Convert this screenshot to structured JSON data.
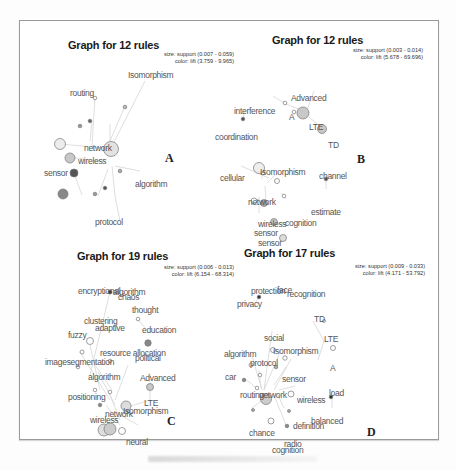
{
  "figure": {
    "caption_visible_text": ""
  },
  "panels": [
    {
      "id": "A",
      "title": "Graph for 12 rules",
      "legend_size": "size: support (0.007 - 0.059)",
      "legend_color": "color: lift (3.759 - 9.965)",
      "label": "A",
      "nodes": [
        "Isomorphism",
        "routing",
        "network",
        "wireless",
        "sensor",
        "algorithm",
        "protocol"
      ]
    },
    {
      "id": "B",
      "title": "Graph for 12 rules",
      "legend_size": "size: support (0.003 - 0.014)",
      "legend_color": "color: lift (5.678 - 69.696)",
      "label": "B",
      "nodes": [
        "Advanced",
        "interference",
        "A",
        "LTE",
        "TD",
        "coordination",
        "cellular",
        "Isomorphism",
        "channel",
        "network",
        "estimate",
        "wireless",
        "cognition",
        "sensor"
      ]
    },
    {
      "id": "C",
      "title": "Graph for 19 rules",
      "legend_size": "size: support (0.006 - 0.013)",
      "legend_color": "color: lift (6.154 - 68.314)",
      "label": "C",
      "nodes": [
        "encryptional",
        "algorithm",
        "chaos",
        "thought",
        "clustering",
        "adaptive",
        "education",
        "fuzzy",
        "resource allocation",
        "political",
        "imagesegmentation",
        "algorithm",
        "Advanced",
        "positioning",
        "LTE",
        "network",
        "Isomorphism",
        "wireless",
        "neural"
      ]
    },
    {
      "id": "D",
      "title": "Graph for 17 rules",
      "legend_size": "size: support (0.009 - 0.033)",
      "legend_color": "color: lift (4.171 - 53.792)",
      "label": "D",
      "nodes": [
        "protection",
        "face",
        "recognition",
        "privacy",
        "TD",
        "social",
        "LTE",
        "algorithm",
        "Isomorphism",
        "protocol",
        "A",
        "car",
        "sensor",
        "routing",
        "network",
        "wireless",
        "load",
        "balanced",
        "chance",
        "definition",
        "radio",
        "cognition"
      ]
    }
  ]
}
